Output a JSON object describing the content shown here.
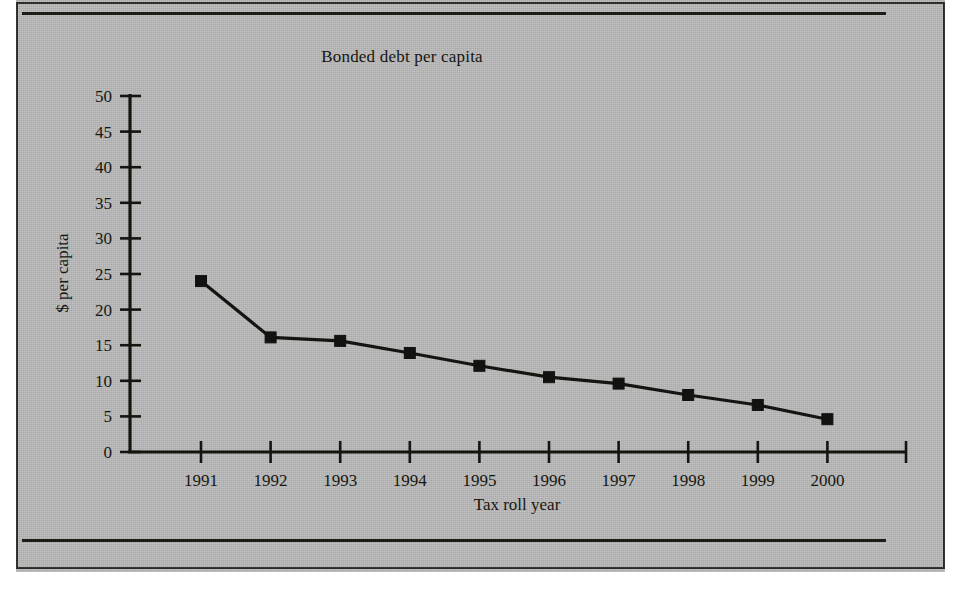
{
  "page": {
    "background_color": "#b9b9b9",
    "frame_color": "#26261f",
    "ink_color": "#15150f"
  },
  "chart_data": {
    "type": "line",
    "title": "Bonded debt per capita",
    "xlabel": "Tax roll year",
    "ylabel": "$ per capita",
    "categories": [
      "1991",
      "1992",
      "1993",
      "1994",
      "1995",
      "1996",
      "1997",
      "1998",
      "1999",
      "2000"
    ],
    "values": [
      24.0,
      16.1,
      15.6,
      13.9,
      12.1,
      10.5,
      9.6,
      8.0,
      6.6,
      4.6
    ],
    "ylim": [
      0,
      50
    ],
    "yticks": [
      0,
      5,
      10,
      15,
      20,
      25,
      30,
      35,
      40,
      45,
      50
    ],
    "ytick_labels": [
      "0",
      "5",
      "10",
      "15",
      "20",
      "25",
      "30",
      "35",
      "40",
      "45",
      "50"
    ],
    "xtick_labels": [
      "1991",
      "1992",
      "1993",
      "1994",
      "1995",
      "1996",
      "1997",
      "1998",
      "1999",
      "2000"
    ],
    "grid": false,
    "legend": false,
    "marker": "square",
    "series_color": "#141410"
  },
  "figure": {
    "rule_top": "horizontal-rule",
    "rule_bottom": "horizontal-rule"
  }
}
